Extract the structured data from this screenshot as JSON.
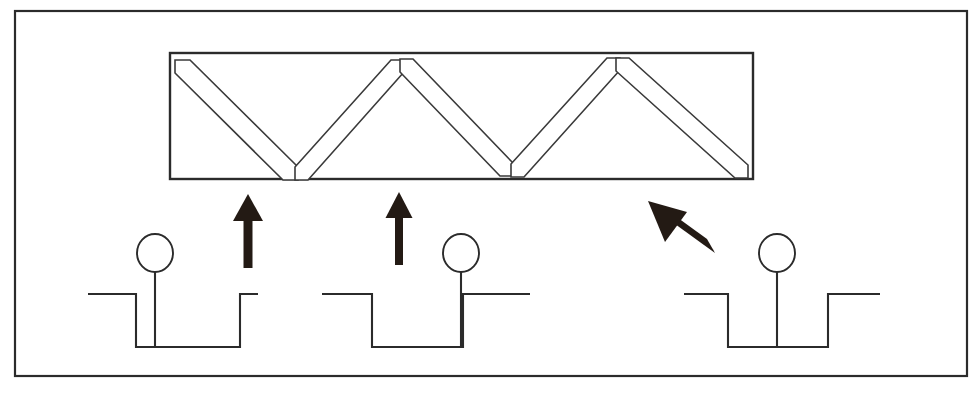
{
  "figure": {
    "title": "",
    "caption": "",
    "background_color": "#ffffff",
    "line_color": "#2b2b2b",
    "arrow_color": "#231a14",
    "fill_color": "#ffffff",
    "width": 978,
    "height": 404
  },
  "outer_frame": {
    "name": "figure-border",
    "x": 15,
    "y": 11,
    "width": 952,
    "height": 365
  },
  "truss_panel": {
    "name": "truss-enclosure",
    "x": 170,
    "y": 53,
    "width": 583,
    "height": 126,
    "strut_count": 6,
    "strut_width": 15,
    "description": "zigzag W-pattern of six diagonal bars"
  },
  "struts": [
    {
      "label": "strut-1",
      "orientation": "down-right",
      "x1": 186,
      "y1": 66,
      "x2": 292,
      "y2": 170
    },
    {
      "label": "strut-2",
      "orientation": "up-right",
      "x1": 303,
      "y1": 172,
      "x2": 400,
      "y2": 66
    },
    {
      "label": "strut-3",
      "orientation": "down-right",
      "x1": 408,
      "y1": 63,
      "x2": 506,
      "y2": 168
    },
    {
      "label": "strut-4",
      "orientation": "up-right",
      "x1": 517,
      "y1": 170,
      "x2": 610,
      "y2": 63
    },
    {
      "label": "strut-5",
      "orientation": "down-right",
      "x1": 623,
      "y1": 62,
      "x2": 742,
      "y2": 169
    },
    {
      "label": "strut-6",
      "orientation": "up-right",
      "x1": 300,
      "y1": 171,
      "x2": 405,
      "y2": 64
    }
  ],
  "arrows": [
    {
      "label": "arrow-left-up",
      "direction": "up",
      "tip_x": 248,
      "tip_y": 194,
      "tail_x": 248,
      "tail_y": 268,
      "shaft_width": 9,
      "head_width": 28,
      "head_length": 26
    },
    {
      "label": "arrow-middle-up",
      "direction": "up",
      "tip_x": 399,
      "tip_y": 192,
      "tail_x": 399,
      "tail_y": 265,
      "shaft_width": 8,
      "head_width": 26,
      "head_length": 25
    },
    {
      "label": "arrow-right-diagonal",
      "direction": "up-left",
      "tip_x": 648,
      "tip_y": 201,
      "tail_x": 714,
      "tail_y": 247,
      "shaft_width": 9,
      "head_width": 27,
      "head_length": 26
    }
  ],
  "wells": [
    {
      "label": "well-left",
      "surface_y": 294,
      "floor_y": 347,
      "left_edge_x": 136,
      "right_edge_x": 240,
      "surface_left_x": 88,
      "surface_right_x": 258,
      "marker_x": 155,
      "circle_cy": 253,
      "circle_r": 18,
      "marker_position": "left-of-center"
    },
    {
      "label": "well-middle",
      "surface_y": 294,
      "floor_y": 347,
      "left_edge_x": 372,
      "right_edge_x": 463,
      "surface_left_x": 322,
      "surface_right_x": 530,
      "marker_x": 463,
      "circle_cy": 253,
      "circle_r": 18,
      "marker_position": "right-edge"
    },
    {
      "label": "well-right",
      "surface_y": 294,
      "floor_y": 347,
      "left_edge_x": 728,
      "right_edge_x": 828,
      "surface_left_x": 684,
      "surface_right_x": 880,
      "marker_x": 777,
      "circle_cy": 253,
      "circle_r": 18,
      "marker_position": "center"
    }
  ]
}
